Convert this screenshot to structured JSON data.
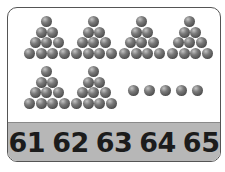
{
  "card": {
    "title": "Counting balls in groups of ten",
    "ball_color": "#5a5a5a",
    "band_color": "#b7b7b7",
    "groups_of_ten": 6,
    "balls_per_group_rows": [
      1,
      2,
      3,
      4
    ],
    "loose_balls": 5,
    "total": 65
  },
  "numbers": [
    "61",
    "62",
    "63",
    "64",
    "65"
  ]
}
